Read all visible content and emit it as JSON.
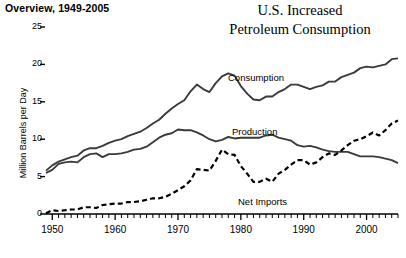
{
  "header": {
    "overview_label": "Overview, 1949-2005"
  },
  "chart_data": {
    "type": "line",
    "title": "U.S. Increased Petroleum Consumption",
    "title_lines": [
      "U.S. Increased",
      "Petroleum Consumption"
    ],
    "xlabel": "",
    "ylabel": "Million Barrels per Day",
    "xlim": [
      1949,
      2005
    ],
    "ylim": [
      0,
      25
    ],
    "grid": false,
    "legend_position": "inline-annotations",
    "y_ticks": [
      0,
      5,
      10,
      15,
      20,
      25
    ],
    "y_tick_labels": [
      "0",
      "5",
      "10",
      "15",
      "20",
      "25"
    ],
    "x_ticks": [
      1950,
      1960,
      1970,
      1980,
      1990,
      2000
    ],
    "x_tick_labels": [
      "1950",
      "1960",
      "1970",
      "1980",
      "1990",
      "2000"
    ],
    "x_minor_tick_interval": 1,
    "x": [
      1949,
      1950,
      1951,
      1952,
      1953,
      1954,
      1955,
      1956,
      1957,
      1958,
      1959,
      1960,
      1961,
      1962,
      1963,
      1964,
      1965,
      1966,
      1967,
      1968,
      1969,
      1970,
      1971,
      1972,
      1973,
      1974,
      1975,
      1976,
      1977,
      1978,
      1979,
      1980,
      1981,
      1982,
      1983,
      1984,
      1985,
      1986,
      1987,
      1988,
      1989,
      1990,
      1991,
      1992,
      1993,
      1994,
      1995,
      1996,
      1997,
      1998,
      1999,
      2000,
      2001,
      2002,
      2003,
      2004,
      2005
    ],
    "series": [
      {
        "name": "Consumption",
        "style": "solid",
        "color": "#3a3a3a",
        "label_text": "Consumption",
        "values": [
          5.8,
          6.5,
          7.0,
          7.3,
          7.6,
          7.8,
          8.5,
          8.8,
          8.8,
          9.1,
          9.5,
          9.8,
          10.0,
          10.4,
          10.7,
          11.0,
          11.5,
          12.1,
          12.6,
          13.4,
          14.1,
          14.7,
          15.2,
          16.4,
          17.3,
          16.7,
          16.3,
          17.5,
          18.4,
          18.8,
          18.5,
          17.1,
          16.1,
          15.3,
          15.2,
          15.7,
          15.7,
          16.3,
          16.7,
          17.3,
          17.3,
          17.0,
          16.7,
          17.0,
          17.2,
          17.7,
          17.7,
          18.3,
          18.6,
          18.9,
          19.5,
          19.7,
          19.6,
          19.8,
          20.0,
          20.7,
          20.8
        ]
      },
      {
        "name": "Production",
        "style": "solid",
        "color": "#3a3a3a",
        "label_text": "Production",
        "values": [
          5.5,
          5.9,
          6.7,
          6.9,
          7.0,
          6.9,
          7.6,
          8.0,
          8.1,
          7.6,
          8.0,
          8.0,
          8.1,
          8.3,
          8.6,
          8.7,
          9.0,
          9.6,
          10.2,
          10.6,
          10.8,
          11.3,
          11.2,
          11.2,
          10.9,
          10.5,
          10.0,
          9.7,
          9.9,
          10.3,
          10.1,
          10.2,
          10.2,
          10.2,
          10.2,
          10.5,
          10.6,
          10.2,
          10.0,
          9.8,
          9.2,
          9.0,
          9.1,
          8.9,
          8.6,
          8.4,
          8.3,
          8.3,
          8.3,
          8.0,
          7.7,
          7.7,
          7.7,
          7.6,
          7.4,
          7.2,
          6.8
        ]
      },
      {
        "name": "Net Imports",
        "style": "dashed",
        "color": "#000000",
        "label_text": "Net Imports",
        "values": [
          0.1,
          0.5,
          0.4,
          0.5,
          0.6,
          0.6,
          0.9,
          0.9,
          0.8,
          1.2,
          1.3,
          1.4,
          1.4,
          1.6,
          1.6,
          1.7,
          1.9,
          2.1,
          2.1,
          2.3,
          2.7,
          3.2,
          3.7,
          4.5,
          6.0,
          5.9,
          5.8,
          7.1,
          8.6,
          8.0,
          7.9,
          6.4,
          5.4,
          4.3,
          4.3,
          4.7,
          4.3,
          5.4,
          5.9,
          6.6,
          7.2,
          7.2,
          6.6,
          6.9,
          7.6,
          8.1,
          7.9,
          8.5,
          9.2,
          9.8,
          10.0,
          10.4,
          10.9,
          10.5,
          11.2,
          12.1,
          12.5
        ]
      }
    ]
  }
}
